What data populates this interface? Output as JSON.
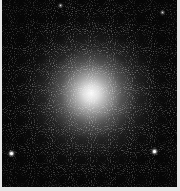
{
  "image": {
    "subject": "globular star cluster",
    "background_color": "#060606",
    "border_color": "#e6e6e6",
    "core_center_pct": [
      51,
      50
    ],
    "bright_stars": [
      {
        "x": 11,
        "y": 153,
        "size": 3
      },
      {
        "x": 154,
        "y": 151,
        "size": 3
      },
      {
        "x": 60,
        "y": 5,
        "size": 1
      },
      {
        "x": 162,
        "y": 12,
        "size": 1
      }
    ]
  }
}
